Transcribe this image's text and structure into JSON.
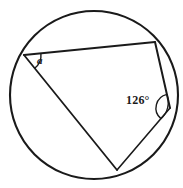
{
  "figure": {
    "stroke_color": "#1a1a1a",
    "fill_color": "#ffffff",
    "background_color": "#ffffff",
    "circle": {
      "name": "circumscribed-circle",
      "center_x": 94,
      "center_y": 95,
      "radius": 84,
      "stroke_width": 2.1
    },
    "vertices": [
      {
        "id": "A",
        "x": 24,
        "y": 55,
        "role": "upper-left-vertex"
      },
      {
        "id": "B",
        "x": 155,
        "y": 42,
        "role": "upper-right-vertex"
      },
      {
        "id": "C",
        "x": 170,
        "y": 108,
        "role": "right-vertex"
      },
      {
        "id": "D",
        "x": 117,
        "y": 170,
        "role": "bottom-vertex"
      }
    ],
    "chords": [
      {
        "name": "chord-AB",
        "from": "A",
        "to": "B",
        "stroke_width": 2.0
      },
      {
        "name": "chord-BC",
        "from": "B",
        "to": "C",
        "stroke_width": 2.0
      },
      {
        "name": "chord-CD",
        "from": "C",
        "to": "D",
        "stroke_width": 1.6
      },
      {
        "name": "chord-AD",
        "from": "A",
        "to": "D",
        "stroke_width": 1.8
      }
    ],
    "angle_marks": [
      {
        "name": "angle-arc-a",
        "at_vertex": "A",
        "radius": 17,
        "stroke_width": 1.4,
        "label": "a",
        "label_style": "italic"
      },
      {
        "name": "angle-arc-126",
        "at_vertex": "C",
        "radius": 14,
        "stroke_width": 1.4,
        "label": "126°",
        "label_style": "upright"
      }
    ],
    "labels": {
      "angle_a": "a",
      "angle_c": "126°"
    }
  }
}
